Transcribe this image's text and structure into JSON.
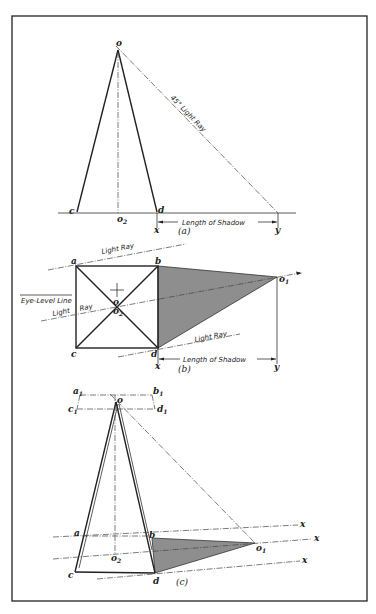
{
  "figure": {
    "frame": {
      "x": 12,
      "y": 16,
      "w": 355,
      "h": 585
    },
    "colors": {
      "ink": "#222222",
      "shadow_fill": "#8e8e8e",
      "paper": "#ffffff"
    },
    "panel_a": {
      "caption": "(a)",
      "labels": {
        "o": "o",
        "c": "c",
        "o2": "o",
        "o2_sub": "2",
        "d": "d",
        "x": "x",
        "y": "y"
      },
      "light_ray_label": "45° Light Ray",
      "shadow_label": "Length of Shadow"
    },
    "panel_b": {
      "caption": "(b)",
      "labels": {
        "a": "a",
        "b": "b",
        "c": "c",
        "d": "d",
        "o": "o",
        "o2": "o",
        "o2_sub": "2",
        "o1": "o",
        "o1_sub": "1",
        "x": "x",
        "y": "y"
      },
      "eye_level_label": "Eye-Level Line",
      "light_ray_top": "Light Ray",
      "light_ray_mid_1": "Light",
      "light_ray_mid_2": "Ray",
      "light_ray_bottom": "Light Ray",
      "shadow_label": "Length of Shadow"
    },
    "panel_c": {
      "caption": "(c)",
      "labels": {
        "a1": "a",
        "a1_sub": "1",
        "b1": "b",
        "b1_sub": "1",
        "c1": "c",
        "c1_sub": "1",
        "d1": "d",
        "d1_sub": "1",
        "o": "o",
        "a": "a",
        "b": "b",
        "c": "c",
        "d": "d",
        "o1": "o",
        "o1_sub": "1",
        "o2": "o",
        "o2_sub": "2",
        "x1": "x",
        "x2": "x",
        "x3": "x"
      }
    }
  }
}
